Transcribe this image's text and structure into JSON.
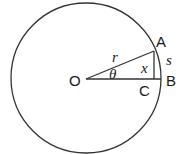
{
  "diagram": {
    "type": "circle-geometry",
    "colors": {
      "stroke": "#333333",
      "text": "#1a1a1a",
      "background": "#ffffff"
    },
    "points": {
      "O": {
        "label": "O"
      },
      "A": {
        "label": "A"
      },
      "B": {
        "label": "B"
      },
      "C": {
        "label": "C"
      }
    },
    "labels": {
      "radius": "r",
      "angle": "θ",
      "height": "x",
      "arc": "s"
    }
  }
}
